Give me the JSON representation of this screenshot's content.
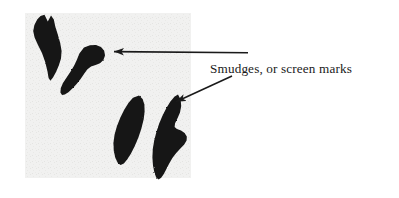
{
  "figure": {
    "name": "smudges-or-screen-marks-illustration",
    "width": 399,
    "height": 198,
    "background_color": "#ffffff"
  },
  "panel": {
    "name": "screen-panel",
    "fill_color": "#f0f0ef",
    "x": 25,
    "y": 13,
    "width": 166,
    "height": 165,
    "left_rule_x": 25,
    "right_rule_x": 191,
    "rule_color": "#1a1a1a",
    "rule_width": 2.2
  },
  "smudges": [
    {
      "id": "smudge-upper-left",
      "label": "upper left vertical smudge",
      "fill_color": "#141414"
    },
    {
      "id": "smudge-upper-right",
      "label": "upper middle curved smudge",
      "fill_color": "#141414"
    },
    {
      "id": "smudge-lower-left",
      "label": "lower middle tapered smudge",
      "fill_color": "#141414"
    },
    {
      "id": "smudge-lower-right",
      "label": "lower right hooked smudge",
      "fill_color": "#141414"
    }
  ],
  "annotation": {
    "caption": "Smudges, or screen marks",
    "caption_x": 210,
    "caption_baseline_y": 73,
    "caption_color": "#1a1a1a",
    "leader_color": "#1a1a1a",
    "leader_width": 1.6,
    "arrows": [
      {
        "id": "arrow-horizontal",
        "label": "horizontal leader to upper smudge",
        "from_x": 248,
        "from_y": 52.5,
        "to_x": 112,
        "to_y": 51.5
      },
      {
        "id": "arrow-diagonal",
        "label": "diagonal leader to lower right smudge",
        "from_x": 232,
        "from_y": 76,
        "to_x": 174,
        "to_y": 103
      }
    ]
  }
}
